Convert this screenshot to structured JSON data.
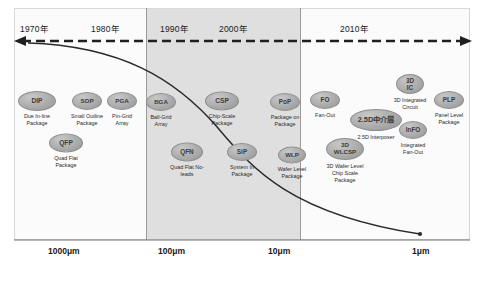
{
  "diagram": {
    "timeline_axis": {
      "name": "timeline-dashed-arrow",
      "direction": "bidirectional",
      "years": [
        {
          "label": "1970年",
          "x": 20
        },
        {
          "label": "1980年",
          "x": 91
        },
        {
          "label": "1990年",
          "x": 160
        },
        {
          "label": "2000年",
          "x": 219
        },
        {
          "label": "2010年",
          "x": 340
        }
      ]
    },
    "size_axis": {
      "ticks": [
        {
          "label": "1000μm",
          "x": 48
        },
        {
          "label": "100μm",
          "x": 158
        },
        {
          "label": "10μm",
          "x": 268
        },
        {
          "label": "1μm",
          "x": 412
        }
      ]
    },
    "highlight_band": {
      "name": "highlight-band",
      "start_year": "1990年",
      "end_year": "2000年"
    },
    "nodes": [
      {
        "abbr": "DIP",
        "caption": "Due In-line\nPackage",
        "cx": 37,
        "cy": 101,
        "rx": 19,
        "ry": 10,
        "fs": 6.6,
        "cap_y": 113
      },
      {
        "abbr": "QFP",
        "caption": "Quad Flat\nPackage",
        "cx": 66,
        "cy": 143,
        "rx": 17,
        "ry": 9.5,
        "fs": 6.6,
        "cap_y": 155
      },
      {
        "abbr": "SOP",
        "caption": "Small Outline\nPackage",
        "cx": 87,
        "cy": 101,
        "rx": 15,
        "ry": 9,
        "fs": 6.2,
        "cap_y": 113
      },
      {
        "abbr": "PGA",
        "caption": "Pin-Grid\nArray",
        "cx": 122,
        "cy": 101,
        "rx": 15,
        "ry": 9,
        "fs": 6.2,
        "cap_y": 113
      },
      {
        "abbr": "BGA",
        "caption": "Ball-Grid\nArray",
        "cx": 161,
        "cy": 102,
        "rx": 15,
        "ry": 9,
        "fs": 6.2,
        "cap_y": 114
      },
      {
        "abbr": "QFN",
        "caption": "Quad Flat No-\nleads",
        "cx": 187,
        "cy": 152,
        "rx": 16,
        "ry": 9.5,
        "fs": 6.4,
        "cap_y": 164
      },
      {
        "abbr": "CSP",
        "caption": "Chip-Scale\nPackage",
        "cx": 222,
        "cy": 101,
        "rx": 17,
        "ry": 9.5,
        "fs": 6.6,
        "cap_y": 113
      },
      {
        "abbr": "SiP",
        "caption": "System In\nPackage",
        "cx": 242,
        "cy": 152,
        "rx": 15,
        "ry": 9,
        "fs": 6.4,
        "cap_y": 164
      },
      {
        "abbr": "PoP",
        "caption": "Package on\nPackage",
        "cx": 285,
        "cy": 102,
        "rx": 15,
        "ry": 9,
        "fs": 6.4,
        "cap_y": 114
      },
      {
        "abbr": "WLP",
        "caption": "Wafer Level\nPackage",
        "cx": 292,
        "cy": 155,
        "rx": 14,
        "ry": 8.5,
        "fs": 6.2,
        "cap_y": 166
      },
      {
        "abbr": "FO",
        "caption": "Fan-Out",
        "cx": 325,
        "cy": 100,
        "rx": 15,
        "ry": 9,
        "fs": 6.4,
        "cap_y": 112
      },
      {
        "abbr": "3D\nWLCSP",
        "caption": "3D Wafer Level\nChip Scale\nPackage",
        "cx": 345,
        "cy": 149,
        "rx": 19,
        "ry": 11,
        "fs": 6.2,
        "cap_y": 163
      },
      {
        "abbr": "2.5D中介层",
        "caption": "2.5D Interposer",
        "cx": 376,
        "cy": 120,
        "rx": 26,
        "ry": 11,
        "fs": 7.4,
        "cap_y": 134
      },
      {
        "abbr": "3D\nIC",
        "caption": "3D Integrated\nCircuit",
        "cx": 410,
        "cy": 84,
        "rx": 14,
        "ry": 10,
        "fs": 6.4,
        "cap_y": 97
      },
      {
        "abbr": "InFO",
        "caption": "Integrated\nFan-Out",
        "cx": 413,
        "cy": 130,
        "rx": 14,
        "ry": 9,
        "fs": 6.4,
        "cap_y": 142
      },
      {
        "abbr": "PLP",
        "caption": "Panel Level\nPackage",
        "cx": 449,
        "cy": 100,
        "rx": 15,
        "ry": 9,
        "fs": 6.4,
        "cap_y": 112
      }
    ]
  },
  "colors": {
    "node_fill": "#a8a8a8",
    "node_stroke": "#8e8e8e",
    "band_fill": "#d9d9d9",
    "curve": "#2a2a2a",
    "frame": "#d8d8d8"
  }
}
